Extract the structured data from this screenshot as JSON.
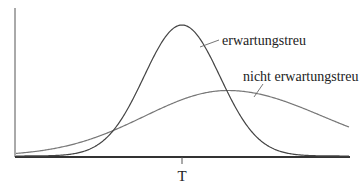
{
  "chart_data": {
    "type": "line",
    "title": "",
    "xlabel": "",
    "ylabel": "",
    "x_ticks": [
      {
        "label": "T",
        "x": 0
      }
    ],
    "grid": false,
    "legend_position": "inline annotations",
    "series": [
      {
        "name": "erwartungstreu",
        "shape": "normal density",
        "center": 0,
        "relative_spread": 1.0,
        "relative_peak_height": 1.0,
        "color": "#444444"
      },
      {
        "name": "nicht erwartungstreu",
        "shape": "normal density (slightly skewed)",
        "center": 1.2,
        "relative_spread": 2.3,
        "relative_peak_height": 0.5,
        "color": "#777777"
      }
    ],
    "annotations": [
      {
        "text": "erwartungstreu",
        "points_to": "erwartungstreu"
      },
      {
        "text": "nicht erwartungstreu",
        "points_to": "nicht erwartungstreu"
      }
    ]
  },
  "labels": {
    "unbiased": "erwartungstreu",
    "biased": "nicht erwartungstreu",
    "tick_T": "T"
  },
  "colors": {
    "axis": "#333333",
    "curve_unbiased": "#444444",
    "curve_biased": "#777777",
    "text": "#222222",
    "background": "#ffffff"
  }
}
